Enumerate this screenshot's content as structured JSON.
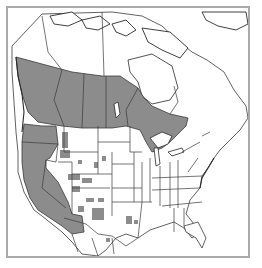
{
  "map": {
    "type": "species-range-map",
    "region": "North America (Canada, United States, northern Mexico)",
    "colors": {
      "range_fill": "#8c8c8c",
      "land_fill": "#ffffff",
      "outline": "#3a3a3a",
      "frame": "#a9a9a9"
    },
    "legend": [],
    "shaded_regions": [
      "British Columbia (southern)",
      "Alberta (southern)",
      "Saskatchewan (southern)",
      "Manitoba (southern)",
      "Ontario (southern)",
      "Washington",
      "Oregon",
      "California",
      "Nevada",
      "Arizona",
      "Idaho (partial)",
      "Utah (patches)",
      "Colorado (patches)",
      "New Mexico (patches)",
      "Texas (patches)",
      "Montana (patches)",
      "Wyoming (patches)"
    ]
  }
}
